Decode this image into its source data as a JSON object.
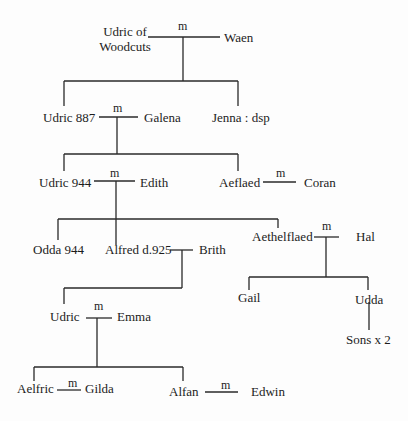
{
  "line_color": "#2a2a2a",
  "people": [
    {
      "id": "udric-woodcuts",
      "label": "Udric of",
      "label2": "Woodcuts",
      "x": 97,
      "y": 24,
      "center": true,
      "w": 56
    },
    {
      "id": "waen",
      "label": "Waen",
      "x": 224,
      "y": 30
    },
    {
      "id": "udric-887",
      "label": "Udric 887",
      "x": 43,
      "y": 110
    },
    {
      "id": "galena",
      "label": "Galena",
      "x": 144,
      "y": 110
    },
    {
      "id": "jenna",
      "label": "Jenna : dsp",
      "x": 212,
      "y": 110
    },
    {
      "id": "udric-944",
      "label": "Udric 944",
      "x": 39,
      "y": 175
    },
    {
      "id": "edith",
      "label": "Edith",
      "x": 140,
      "y": 175
    },
    {
      "id": "aeflaed",
      "label": "Aeflaed",
      "x": 219,
      "y": 175
    },
    {
      "id": "coran",
      "label": "Coran",
      "x": 304,
      "y": 175
    },
    {
      "id": "odda-944",
      "label": "Odda 944",
      "x": 33,
      "y": 242
    },
    {
      "id": "alfred",
      "label": "Alfred d.925",
      "x": 105,
      "y": 242
    },
    {
      "id": "brith",
      "label": "Brith",
      "x": 199,
      "y": 242
    },
    {
      "id": "aethelflaed",
      "label": "Aethelflaed",
      "x": 252,
      "y": 229
    },
    {
      "id": "hal",
      "label": "Hal",
      "x": 356,
      "y": 229
    },
    {
      "id": "gail",
      "label": "Gail",
      "x": 238,
      "y": 290
    },
    {
      "id": "udda",
      "label": "Udda",
      "x": 355,
      "y": 292
    },
    {
      "id": "sons",
      "label": "Sons x 2",
      "x": 346,
      "y": 332
    },
    {
      "id": "udric",
      "label": "Udric",
      "x": 50,
      "y": 309
    },
    {
      "id": "emma",
      "label": "Emma",
      "x": 117,
      "y": 309
    },
    {
      "id": "aelfric",
      "label": "Aelfric",
      "x": 17,
      "y": 381
    },
    {
      "id": "gilda",
      "label": "Gilda",
      "x": 85,
      "y": 381
    },
    {
      "id": "alfan",
      "label": "Alfan",
      "x": 169,
      "y": 384
    },
    {
      "id": "edwin",
      "label": "Edwin",
      "x": 251,
      "y": 384
    }
  ],
  "marriage_marks": [
    {
      "label": "m",
      "x": 178,
      "y": 20
    },
    {
      "label": "m",
      "x": 113,
      "y": 102
    },
    {
      "label": "m",
      "x": 110,
      "y": 167
    },
    {
      "label": "m",
      "x": 276,
      "y": 167
    },
    {
      "label": "m",
      "x": 322,
      "y": 220
    },
    {
      "label": "m",
      "x": 94,
      "y": 300
    },
    {
      "label": "m",
      "x": 68,
      "y": 377
    },
    {
      "label": "m",
      "x": 221,
      "y": 379
    }
  ],
  "lines": [
    [
      148,
      37,
      220,
      37
    ],
    [
      183,
      37,
      183,
      81
    ],
    [
      64,
      81,
      238,
      81
    ],
    [
      64,
      81,
      64,
      106
    ],
    [
      238,
      81,
      238,
      106
    ],
    [
      99,
      117,
      138,
      117
    ],
    [
      117,
      117,
      117,
      154
    ],
    [
      64,
      154,
      238,
      154
    ],
    [
      64,
      154,
      64,
      171
    ],
    [
      238,
      154,
      238,
      171
    ],
    [
      94,
      181,
      135,
      181
    ],
    [
      116,
      181,
      116,
      245
    ],
    [
      263,
      182,
      296,
      182
    ],
    [
      58,
      219,
      278,
      219
    ],
    [
      58,
      219,
      58,
      240
    ],
    [
      278,
      219,
      278,
      228
    ],
    [
      314,
      237,
      339,
      237
    ],
    [
      326,
      237,
      326,
      277
    ],
    [
      249,
      277,
      368,
      277
    ],
    [
      249,
      277,
      249,
      290
    ],
    [
      368,
      277,
      368,
      290
    ],
    [
      369,
      302,
      369,
      330
    ],
    [
      170,
      250,
      193,
      250
    ],
    [
      182,
      250,
      182,
      288
    ],
    [
      64,
      288,
      182,
      288
    ],
    [
      64,
      288,
      64,
      304
    ],
    [
      86,
      318,
      112,
      318
    ],
    [
      97,
      318,
      97,
      367
    ],
    [
      34,
      367,
      183,
      367
    ],
    [
      34,
      367,
      34,
      381
    ],
    [
      183,
      367,
      183,
      381
    ],
    [
      57,
      390,
      81,
      390
    ],
    [
      205,
      392,
      238,
      392
    ]
  ]
}
